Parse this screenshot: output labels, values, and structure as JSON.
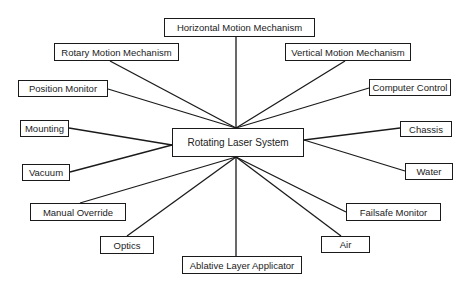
{
  "diagram": {
    "center": {
      "label": "Rotating Laser System",
      "x": 172,
      "y": 128,
      "w": 132,
      "h": 29
    },
    "hub_top": {
      "x": 236,
      "y": 128
    },
    "hub_bottom": {
      "x": 236,
      "y": 157
    },
    "nodes": [
      {
        "id": "horizontal-motion-mechanism",
        "label": "Horizontal Motion Mechanism",
        "x": 164,
        "y": 18,
        "w": 151,
        "h": 19,
        "ax": 236,
        "ay": 37,
        "hub": "top"
      },
      {
        "id": "rotary-motion-mechanism",
        "label": "Rotary Motion Mechanism",
        "x": 54,
        "y": 43,
        "w": 125,
        "h": 18,
        "ax": 110,
        "ay": 61,
        "hub": "top"
      },
      {
        "id": "vertical-motion-mechanism",
        "label": "Vertical Motion Mechanism",
        "x": 285,
        "y": 43,
        "w": 126,
        "h": 18,
        "ax": 345,
        "ay": 61,
        "hub": "top"
      },
      {
        "id": "position-monitor",
        "label": "Position Monitor",
        "x": 18,
        "y": 80,
        "w": 90,
        "h": 17,
        "ax": 108,
        "ay": 89,
        "hub": "top"
      },
      {
        "id": "computer-control",
        "label": "Computer Control",
        "x": 369,
        "y": 79,
        "w": 82,
        "h": 17,
        "ax": 369,
        "ay": 88,
        "hub": "top"
      },
      {
        "id": "mounting",
        "label": "Mounting",
        "x": 20,
        "y": 120,
        "w": 49,
        "h": 17,
        "ax": 69,
        "ay": 128,
        "hub": "left"
      },
      {
        "id": "chassis",
        "label": "Chassis",
        "x": 400,
        "y": 121,
        "w": 52,
        "h": 16,
        "ax": 400,
        "ay": 128,
        "hub": "right"
      },
      {
        "id": "vacuum",
        "label": "Vacuum",
        "x": 22,
        "y": 164,
        "w": 48,
        "h": 17,
        "ax": 70,
        "ay": 172,
        "hub": "left"
      },
      {
        "id": "water",
        "label": "Water",
        "x": 405,
        "y": 163,
        "w": 48,
        "h": 17,
        "ax": 405,
        "ay": 171,
        "hub": "right"
      },
      {
        "id": "manual-override",
        "label": "Manual Override",
        "x": 30,
        "y": 203,
        "w": 96,
        "h": 18,
        "ax": 80,
        "ay": 203,
        "hub": "bottom"
      },
      {
        "id": "failsafe-monitor",
        "label": "Failsafe Monitor",
        "x": 346,
        "y": 203,
        "w": 95,
        "h": 18,
        "ax": 346,
        "ay": 212,
        "hub": "bottom"
      },
      {
        "id": "optics",
        "label": "Optics",
        "x": 100,
        "y": 236,
        "w": 54,
        "h": 18,
        "ax": 127,
        "ay": 236,
        "hub": "bottom"
      },
      {
        "id": "air",
        "label": "Air",
        "x": 321,
        "y": 236,
        "w": 49,
        "h": 17,
        "ax": 341,
        "ay": 236,
        "hub": "bottom"
      },
      {
        "id": "ablative-layer-applicator",
        "label": "Ablative Layer Applicator",
        "x": 182,
        "y": 256,
        "w": 120,
        "h": 18,
        "ax": 236,
        "ay": 256,
        "hub": "bottom"
      }
    ],
    "hub_left": {
      "x": 172,
      "y": 145
    },
    "hub_right": {
      "x": 304,
      "y": 140
    },
    "line_color": "#1a1a1a",
    "box_border_color": "#1a1a1a",
    "text_color": "#222222"
  }
}
